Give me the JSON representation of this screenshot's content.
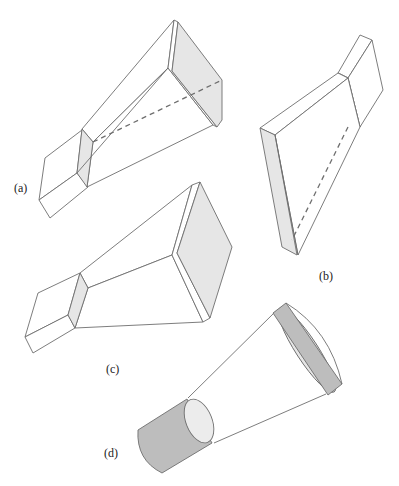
{
  "figure": {
    "colors": {
      "line": "#6e6e6e",
      "aperture_light": "#e6e6e6",
      "cylinder_dark": "#bdbdbd",
      "label": "#222222"
    },
    "panels": [
      {
        "id": "a",
        "label": "(a)",
        "type": "E-plane sectoral horn"
      },
      {
        "id": "b",
        "label": "(b)",
        "type": "H-plane sectoral horn"
      },
      {
        "id": "c",
        "label": "(c)",
        "type": "Pyramidal horn"
      },
      {
        "id": "d",
        "label": "(d)",
        "type": "Conical horn"
      }
    ]
  }
}
